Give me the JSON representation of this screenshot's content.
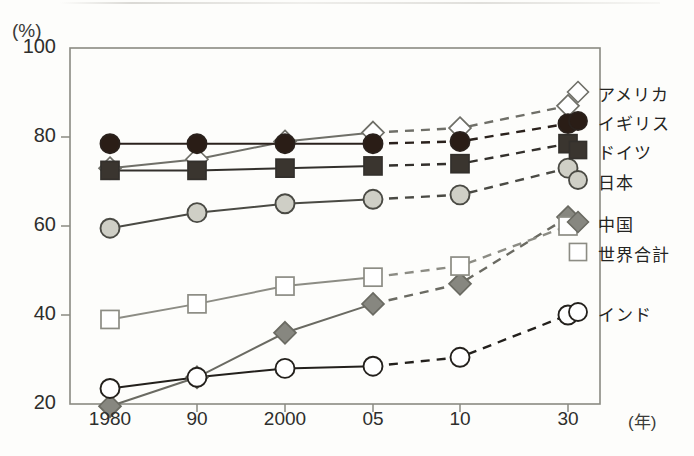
{
  "chart_data": {
    "type": "line",
    "title": "",
    "subtitle": "",
    "xlabel": "(年)",
    "ylabel": "(%)",
    "x": [
      "1980",
      "90",
      "2000",
      "05",
      "10",
      "30"
    ],
    "xtick_labels": [
      "1980",
      "90",
      "2000",
      "05",
      "10",
      "30"
    ],
    "ytick_labels": [
      "20",
      "40",
      "60",
      "80",
      "100"
    ],
    "ytick_values": [
      20,
      40,
      60,
      80,
      100
    ],
    "ylim": [
      20,
      100
    ],
    "grid": false,
    "legend_position": "right",
    "forecast_note": "Solid line up to 05; dashed line from 05 onward indicates projection",
    "series": [
      {
        "name": "アメリカ",
        "marker": "open-diamond",
        "color": "#6f6f68",
        "marker_fill": "#ffffff",
        "values": [
          73,
          75,
          79,
          81,
          82,
          87
        ]
      },
      {
        "name": "イギリス",
        "marker": "filled-circle",
        "color": "#2a211c",
        "marker_fill": "#2a1d16",
        "values": [
          78.5,
          78.5,
          78.5,
          78.5,
          79,
          83
        ]
      },
      {
        "name": "ドイツ",
        "marker": "filled-square",
        "color": "#33302c",
        "marker_fill": "#3a352f",
        "values": [
          72.5,
          72.5,
          73,
          73.5,
          74,
          78.5
        ]
      },
      {
        "name": "日本",
        "marker": "gray-circle",
        "color": "#4a4a44",
        "marker_fill": "#cfcfc6",
        "values": [
          59.5,
          63,
          65,
          66,
          67,
          73
        ]
      },
      {
        "name": "中国",
        "marker": "gray-diamond",
        "color": "#6a6a62",
        "marker_fill": "#878780",
        "values": [
          19.5,
          26,
          36,
          42.5,
          47,
          62
        ]
      },
      {
        "name": "世界合計",
        "marker": "open-square",
        "color": "#8c8c84",
        "marker_fill": "#ffffff",
        "values": [
          39,
          42.5,
          46.5,
          48.5,
          51,
          60
        ]
      },
      {
        "name": "インド",
        "marker": "open-circle",
        "color": "#23201c",
        "marker_fill": "#ffffff",
        "values": [
          23.5,
          26,
          28,
          28.5,
          30.5,
          40
        ]
      }
    ]
  },
  "legend": {
    "entries": [
      {
        "label": "アメリカ"
      },
      {
        "label": "イギリス"
      },
      {
        "label": "ドイツ"
      },
      {
        "label": "日本"
      },
      {
        "label": "中国"
      },
      {
        "label": "世界合計"
      },
      {
        "label": "インド"
      }
    ]
  },
  "axes": {
    "y_unit": "(%)",
    "x_unit": "(年)"
  }
}
